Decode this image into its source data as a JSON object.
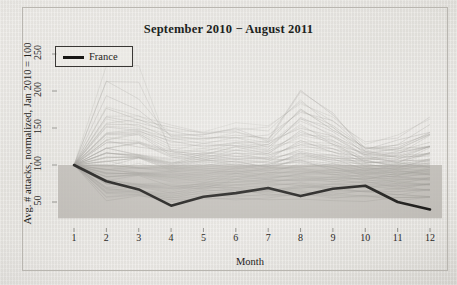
{
  "figure": {
    "width": 457,
    "height": 285,
    "background_color": "#e8e6e2",
    "frame_color": "#b9b6b0"
  },
  "chart_data": {
    "type": "line",
    "title": "September 2010 − August 2011",
    "xlabel": "Month",
    "ylabel": "Avg. # attacks, normalized, Jan 2010 = 100",
    "x": [
      1,
      2,
      3,
      4,
      5,
      6,
      7,
      8,
      9,
      10,
      11,
      12
    ],
    "xticklabels": [
      "1",
      "2",
      "3",
      "4",
      "5",
      "6",
      "7",
      "8",
      "9",
      "10",
      "11",
      "12"
    ],
    "yticks": [
      50,
      100,
      150,
      200,
      250
    ],
    "yticklabels": [
      "50",
      "100",
      "150",
      "200",
      "250"
    ],
    "xlim": [
      1,
      12
    ],
    "ylim": [
      28,
      262
    ],
    "grid": false,
    "legend": {
      "position": "upper-left",
      "entries": [
        {
          "label": "France",
          "color": "#171614",
          "linewidth": 2.5
        }
      ]
    },
    "annotations": {
      "shaded_band": {
        "description": "gray band from baseline up to 100",
        "y_top": 100,
        "y_bottom": 28,
        "color": "#b7b4ae"
      }
    },
    "series": [
      {
        "name": "France",
        "highlight": true,
        "color": "#171614",
        "linewidth": 2.6,
        "values": [
          100,
          78,
          67,
          45,
          57,
          62,
          69,
          58,
          68,
          72,
          50,
          40
        ]
      },
      {
        "name": "other countries",
        "highlight": false,
        "color": "#9a9792",
        "linewidth": 0.55,
        "count": 80,
        "note": "light gray background lines, all normalized to 100 at month 1",
        "values_sample": [
          [
            100,
            228,
            229,
            113,
            120,
            128,
            124,
            131,
            128,
            104,
            100,
            117
          ],
          [
            100,
            194,
            165,
            142,
            139,
            141,
            135,
            199,
            163,
            121,
            119,
            131
          ],
          [
            100,
            168,
            176,
            151,
            145,
            155,
            147,
            186,
            166,
            126,
            137,
            176
          ],
          [
            100,
            161,
            160,
            139,
            138,
            143,
            138,
            176,
            154,
            122,
            126,
            141
          ],
          [
            100,
            152,
            150,
            132,
            133,
            136,
            131,
            165,
            147,
            118,
            121,
            133
          ],
          [
            100,
            145,
            143,
            126,
            128,
            130,
            126,
            156,
            140,
            115,
            117,
            127
          ],
          [
            100,
            139,
            137,
            121,
            123,
            125,
            122,
            148,
            134,
            112,
            113,
            122
          ],
          [
            100,
            133,
            131,
            117,
            119,
            121,
            118,
            141,
            129,
            110,
            110,
            118
          ],
          [
            100,
            128,
            126,
            113,
            115,
            117,
            115,
            135,
            124,
            108,
            107,
            114
          ],
          [
            100,
            123,
            122,
            110,
            112,
            114,
            112,
            129,
            120,
            106,
            105,
            111
          ],
          [
            100,
            119,
            118,
            107,
            109,
            111,
            109,
            124,
            116,
            104,
            103,
            108
          ],
          [
            100,
            115,
            114,
            104,
            106,
            108,
            106,
            119,
            112,
            102,
            101,
            105
          ],
          [
            100,
            111,
            110,
            101,
            103,
            105,
            104,
            115,
            109,
            101,
            99,
            102
          ],
          [
            100,
            108,
            107,
            99,
            101,
            103,
            101,
            111,
            106,
            99,
            97,
            100
          ],
          [
            100,
            104,
            104,
            96,
            98,
            100,
            99,
            107,
            103,
            97,
            95,
            98
          ],
          [
            100,
            101,
            101,
            94,
            96,
            98,
            97,
            103,
            100,
            95,
            93,
            95
          ],
          [
            100,
            98,
            98,
            91,
            93,
            95,
            94,
            100,
            97,
            93,
            91,
            93
          ],
          [
            100,
            95,
            95,
            89,
            91,
            93,
            92,
            97,
            94,
            91,
            89,
            91
          ],
          [
            100,
            92,
            92,
            86,
            88,
            90,
            89,
            93,
            91,
            89,
            87,
            88
          ],
          [
            100,
            89,
            89,
            84,
            86,
            88,
            87,
            90,
            88,
            86,
            84,
            86
          ],
          [
            100,
            86,
            86,
            81,
            83,
            85,
            84,
            87,
            85,
            84,
            82,
            83
          ],
          [
            100,
            83,
            83,
            78,
            80,
            82,
            81,
            84,
            82,
            82,
            80,
            81
          ],
          [
            100,
            80,
            80,
            75,
            77,
            79,
            78,
            81,
            79,
            79,
            77,
            78
          ],
          [
            100,
            77,
            77,
            72,
            74,
            76,
            75,
            78,
            76,
            76,
            74,
            75
          ],
          [
            100,
            74,
            73,
            69,
            71,
            73,
            72,
            74,
            73,
            73,
            71,
            72
          ],
          [
            100,
            71,
            70,
            66,
            68,
            70,
            69,
            71,
            70,
            70,
            68,
            69
          ],
          [
            100,
            68,
            67,
            62,
            64,
            67,
            66,
            68,
            67,
            67,
            65,
            66
          ],
          [
            100,
            64,
            63,
            59,
            61,
            63,
            62,
            64,
            63,
            63,
            61,
            62
          ],
          [
            100,
            60,
            59,
            55,
            57,
            59,
            58,
            60,
            59,
            59,
            57,
            58
          ],
          [
            100,
            56,
            55,
            51,
            53,
            55,
            54,
            56,
            55,
            55,
            53,
            54
          ]
        ]
      }
    ]
  }
}
